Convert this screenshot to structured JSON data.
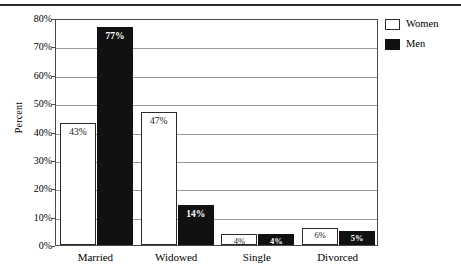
{
  "chart_data": {
    "type": "bar",
    "title": "",
    "xlabel": "",
    "ylabel": "Percent",
    "ylim": [
      0,
      80
    ],
    "ytick_labels": [
      "80%",
      "70%",
      "60%",
      "50%",
      "40%",
      "30%",
      "20%",
      "10%",
      "0%"
    ],
    "ytick_values": [
      80,
      70,
      60,
      50,
      40,
      30,
      20,
      10,
      0
    ],
    "grid": true,
    "legend_position": "top-right",
    "categories": [
      "Married",
      "Widowed",
      "Single",
      "Divorced"
    ],
    "series": [
      {
        "name": "Women",
        "color": "#ffffff",
        "values": [
          43,
          47,
          4,
          6
        ],
        "data_labels": [
          "43%",
          "47%",
          "4%",
          "6%"
        ]
      },
      {
        "name": "Men",
        "color": "#111111",
        "values": [
          77,
          14,
          4,
          5
        ],
        "data_labels": [
          "77%",
          "14%",
          "4%",
          "5%"
        ]
      }
    ]
  },
  "legend": {
    "items": [
      {
        "label": "Women",
        "swatch": "white-square-swatch"
      },
      {
        "label": "Men",
        "swatch": "black-square-swatch"
      }
    ]
  },
  "colors": {
    "bar_women": "#ffffff",
    "bar_men": "#111111",
    "axis": "#4a4a4a",
    "gridline": "#9a9a9a",
    "rule": "#2b2b2b",
    "background": "#ffffff"
  }
}
